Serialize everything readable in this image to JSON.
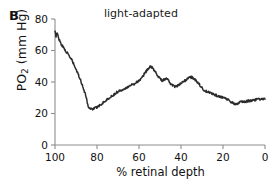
{
  "figure": {
    "panel_label": "B",
    "title": "light-adapted"
  },
  "axes": {
    "ylabel_main": "PO",
    "ylabel_sub": "2",
    "ylabel_units": " (mm Hg)",
    "ylabel_full": "PO2 (mm Hg)",
    "xlabel": "% retinal depth",
    "y_ticks": [
      "0",
      "20",
      "40",
      "60",
      "80"
    ],
    "x_ticks": [
      "100",
      "80",
      "60",
      "40",
      "20",
      "0"
    ]
  },
  "chart_data": {
    "type": "line",
    "title": "light-adapted",
    "xlabel": "% retinal depth",
    "ylabel": "PO2 (mm Hg)",
    "xlim": [
      100,
      0
    ],
    "ylim": [
      0,
      80
    ],
    "x_reversed": true,
    "grid": false,
    "legend": "none",
    "yticks": [
      0,
      20,
      40,
      60,
      80
    ],
    "xticks": [
      100,
      80,
      60,
      40,
      20,
      0
    ],
    "series": [
      {
        "name": "PO2 profile (light-adapted)",
        "x": [
          100,
          99.5,
          99,
          98,
          97,
          96,
          95,
          94,
          93,
          92,
          91,
          90,
          89,
          88,
          87,
          86,
          85,
          84.5,
          84,
          83,
          82,
          81,
          80,
          79,
          78,
          77,
          76,
          75,
          74,
          73,
          72,
          71,
          70,
          69,
          68,
          67,
          66,
          65,
          64,
          63,
          62,
          61,
          60,
          59,
          58,
          57,
          56,
          55,
          54.5,
          54,
          53,
          52,
          51,
          50,
          49,
          48,
          47,
          46,
          45,
          44,
          43,
          42,
          41,
          40,
          39,
          38,
          37,
          36,
          35,
          34,
          33,
          32,
          31,
          30,
          29,
          28,
          27,
          26,
          25,
          24,
          23,
          22,
          21,
          20,
          19,
          18,
          17,
          16,
          15,
          14,
          13,
          12,
          11,
          10,
          9,
          8,
          7,
          6,
          5,
          4,
          3,
          2,
          1,
          0
        ],
        "y": [
          72,
          69,
          71,
          67,
          64,
          62,
          60,
          58,
          56,
          54,
          51,
          48,
          45,
          42,
          38,
          34,
          30,
          26,
          24,
          23,
          23,
          23.5,
          24,
          25,
          26,
          27,
          28,
          29,
          30,
          31,
          32,
          33,
          34,
          34.5,
          35,
          36,
          36.5,
          37,
          38,
          38.5,
          39,
          40,
          41,
          42,
          44,
          46,
          48,
          49,
          50,
          49.5,
          48,
          46,
          44,
          42,
          41,
          41.5,
          42,
          41,
          39,
          38,
          37,
          37.5,
          38,
          39,
          40,
          41,
          42,
          43,
          43,
          42.5,
          41,
          40,
          38,
          36,
          35,
          34,
          33.5,
          33,
          32.5,
          32,
          31.5,
          31,
          30.5,
          30.5,
          30,
          29,
          28,
          27,
          26.5,
          26,
          26.5,
          27,
          27.5,
          27.5,
          27.5,
          28,
          28,
          28.5,
          28.5,
          29,
          29,
          29,
          29,
          29
        ]
      }
    ],
    "features": {
      "start_value": 72,
      "minimum": {
        "x": 83.5,
        "y": 23
      },
      "primary_peak": {
        "x": 54.5,
        "y": 50
      },
      "secondary_peak": {
        "x": 33,
        "y": 43
      },
      "end_plateau": 29
    }
  }
}
